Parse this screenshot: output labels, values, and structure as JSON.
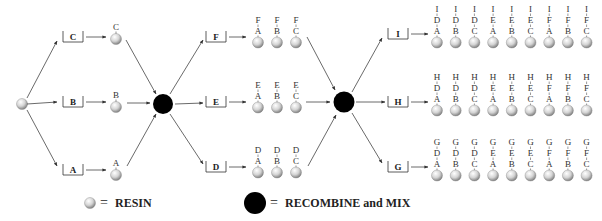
{
  "legend": {
    "resin_label": "RESIN",
    "recombine_label": "RECOMBINE and MIX",
    "equals": "="
  },
  "colors": {
    "resin_light": "#f2f2f2",
    "resin_dark": "#8a8a8a",
    "mix_node": "#000000",
    "line": "#444444"
  },
  "round1": {
    "boxes": [
      "C",
      "B",
      "A"
    ],
    "products": [
      "C",
      "B",
      "A"
    ]
  },
  "round2": {
    "boxes": [
      "F",
      "E",
      "D"
    ],
    "products": [
      [
        "F",
        "A"
      ],
      [
        "F",
        "B"
      ],
      [
        "F",
        "C"
      ],
      [
        "E",
        "A"
      ],
      [
        "E",
        "B"
      ],
      [
        "E",
        "C"
      ],
      [
        "D",
        "A"
      ],
      [
        "D",
        "B"
      ],
      [
        "D",
        "C"
      ]
    ]
  },
  "round3": {
    "boxes": [
      "I",
      "H",
      "G"
    ],
    "products": {
      "I": [
        [
          "I",
          "D",
          "A"
        ],
        [
          "I",
          "D",
          "B"
        ],
        [
          "I",
          "D",
          "C"
        ],
        [
          "I",
          "E",
          "A"
        ],
        [
          "I",
          "E",
          "B"
        ],
        [
          "I",
          "E",
          "C"
        ],
        [
          "I",
          "F",
          "A"
        ],
        [
          "I",
          "F",
          "B"
        ],
        [
          "I",
          "F",
          "C"
        ]
      ],
      "H": [
        [
          "H",
          "D",
          "A"
        ],
        [
          "H",
          "D",
          "B"
        ],
        [
          "H",
          "D",
          "C"
        ],
        [
          "H",
          "E",
          "A"
        ],
        [
          "H",
          "E",
          "B"
        ],
        [
          "H",
          "E",
          "C"
        ],
        [
          "H",
          "F",
          "A"
        ],
        [
          "H",
          "F",
          "B"
        ],
        [
          "H",
          "F",
          "C"
        ]
      ],
      "G": [
        [
          "G",
          "D",
          "A"
        ],
        [
          "G",
          "D",
          "B"
        ],
        [
          "G",
          "D",
          "C"
        ],
        [
          "G",
          "E",
          "A"
        ],
        [
          "G",
          "E",
          "B"
        ],
        [
          "G",
          "E",
          "C"
        ],
        [
          "G",
          "F",
          "A"
        ],
        [
          "G",
          "F",
          "B"
        ],
        [
          "G",
          "F",
          "C"
        ]
      ]
    }
  }
}
